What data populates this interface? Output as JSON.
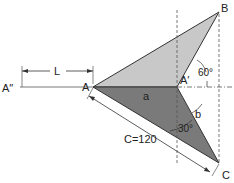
{
  "diagram": {
    "points": {
      "A": "A",
      "A_prime": "A′",
      "A_double_prime": "A″",
      "B": "B",
      "C": "C"
    },
    "labels": {
      "L": "L",
      "a": "a",
      "b": "b",
      "C_dim": "C=120",
      "angle_60": "60°",
      "angle_30": "30°"
    },
    "colors": {
      "upper_triangle": "#c8c8c8",
      "lower_triangle": "#7a7a7a",
      "stroke": "#333333"
    }
  }
}
